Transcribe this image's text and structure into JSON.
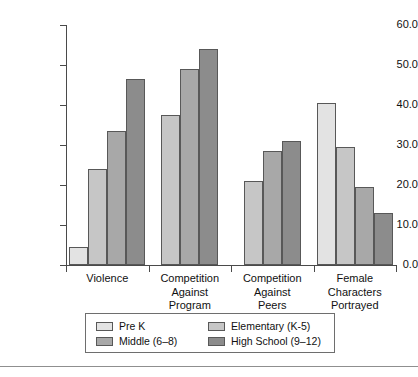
{
  "chart_data": {
    "type": "bar",
    "title": "",
    "subtitle": "",
    "xlabel": "",
    "ylabel": "",
    "ylim": [
      0.0,
      60.0
    ],
    "ytick_labels": [
      "60.0",
      "50.0",
      "40.0",
      "30.0",
      "20.0",
      "10.0",
      "0.0"
    ],
    "ytick_values": [
      60.0,
      50.0,
      40.0,
      30.0,
      20.0,
      10.0,
      0.0
    ],
    "grid": false,
    "legend_position": "below-axes",
    "categories": [
      "Violence",
      "Competition Against Program",
      "Competition Against Peers",
      "Female Characters Portrayed"
    ],
    "category_lines": [
      [
        "Violence"
      ],
      [
        "Competition",
        "Against",
        "Program"
      ],
      [
        "Competition",
        "Against",
        "Peers"
      ],
      [
        "Female",
        "Characters",
        "Portrayed"
      ]
    ],
    "series": [
      {
        "name": "Pre K",
        "color": "#e3e3e3",
        "values": [
          4.5,
          null,
          null,
          40.5
        ]
      },
      {
        "name": "Elementary (K-5)",
        "color": "#c6c6c6",
        "values": [
          24.0,
          37.5,
          21.0,
          29.5
        ]
      },
      {
        "name": "Middle (6–8)",
        "color": "#a8a8a8",
        "values": [
          33.5,
          49.0,
          28.5,
          19.5
        ]
      },
      {
        "name": "High School  (9–12)",
        "color": "#8c8c8c",
        "values": [
          46.5,
          54.0,
          31.0,
          13.0
        ]
      }
    ]
  },
  "legend": {
    "entries": [
      {
        "label": "Pre K"
      },
      {
        "label": "Elementary (K-5)"
      },
      {
        "label": "Middle (6–8)"
      },
      {
        "label": "High School  (9–12)"
      }
    ]
  }
}
